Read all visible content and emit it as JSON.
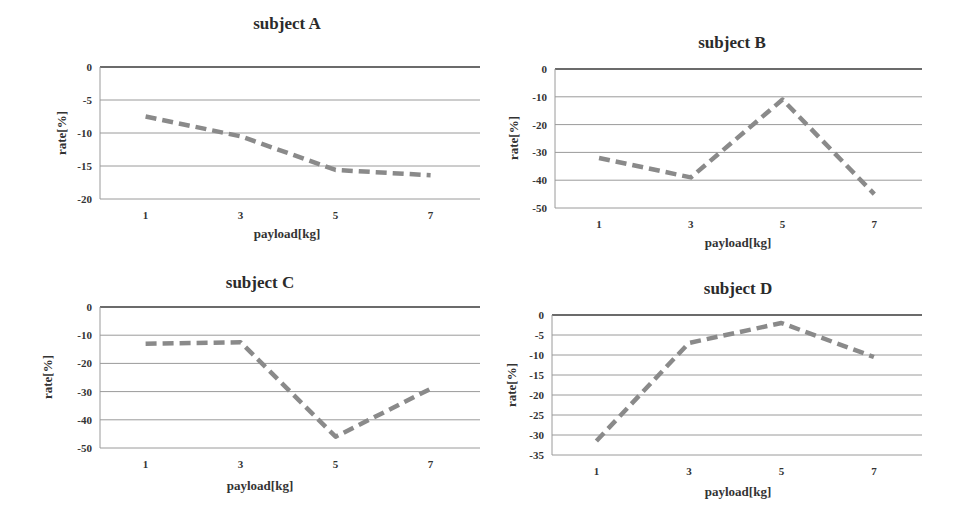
{
  "chart_data": [
    {
      "type": "line",
      "title": "subject A",
      "xlabel": "payload[kg]",
      "ylabel": "rate[%]",
      "categories": [
        "1",
        "3",
        "5",
        "7"
      ],
      "values": [
        -7.5,
        -10.5,
        -15.6,
        -16.4
      ],
      "ylim": [
        -20,
        0
      ],
      "yticks": [
        0,
        -5,
        -10,
        -15,
        -20
      ],
      "grid": true,
      "line_style": "dashed",
      "line_color": "#8a8a8a"
    },
    {
      "type": "line",
      "title": "subject B",
      "xlabel": "payload[kg]",
      "ylabel": "rate[%]",
      "categories": [
        "1",
        "3",
        "5",
        "7"
      ],
      "values": [
        -32,
        -39,
        -11,
        -45
      ],
      "ylim": [
        -50,
        0
      ],
      "yticks": [
        0,
        -10,
        -20,
        -30,
        -40,
        -50
      ],
      "grid": true,
      "line_style": "dashed",
      "line_color": "#8a8a8a"
    },
    {
      "type": "line",
      "title": "subject C",
      "xlabel": "payload[kg]",
      "ylabel": "rate[%]",
      "categories": [
        "1",
        "3",
        "5",
        "7"
      ],
      "values": [
        -13,
        -12.5,
        -46,
        -29
      ],
      "ylim": [
        -50,
        0
      ],
      "yticks": [
        0,
        -10,
        -20,
        -30,
        -40,
        -50
      ],
      "grid": true,
      "line_style": "dashed",
      "line_color": "#8a8a8a"
    },
    {
      "type": "line",
      "title": "subject D",
      "xlabel": "payload[kg]",
      "ylabel": "rate[%]",
      "categories": [
        "1",
        "3",
        "5",
        "7"
      ],
      "values": [
        -31.5,
        -7,
        -2,
        -10.5
      ],
      "ylim": [
        -35,
        0
      ],
      "yticks": [
        0,
        -5,
        -10,
        -15,
        -20,
        -25,
        -30,
        -35
      ],
      "grid": true,
      "line_style": "dashed",
      "line_color": "#8a8a8a"
    }
  ],
  "layout": [
    {
      "panel": {
        "left": 0,
        "top": 0
      },
      "plot": {
        "x0": 100,
        "x1": 480,
        "y0": 67,
        "y1": 199
      },
      "title_center": [
        287,
        24
      ],
      "xlabel_center": [
        287,
        234
      ],
      "ylabel_center": [
        62,
        133
      ]
    },
    {
      "panel": {
        "left": 0,
        "top": 0
      },
      "plot": {
        "x0": 555,
        "x1": 922,
        "y0": 69,
        "y1": 208
      },
      "title_center": [
        732,
        43
      ],
      "xlabel_center": [
        738,
        243
      ],
      "ylabel_center": [
        514,
        138
      ]
    },
    {
      "panel": {
        "left": 0,
        "top": 0
      },
      "plot": {
        "x0": 100,
        "x1": 480,
        "y0": 307,
        "y1": 448
      },
      "title_center": [
        260,
        283
      ],
      "xlabel_center": [
        260,
        486
      ],
      "ylabel_center": [
        48,
        377
      ]
    },
    {
      "panel": {
        "left": 0,
        "top": 0
      },
      "plot": {
        "x0": 552,
        "x1": 922,
        "y0": 315,
        "y1": 455
      },
      "title_center": [
        738,
        289
      ],
      "xlabel_center": [
        738,
        492
      ],
      "ylabel_center": [
        512,
        385
      ]
    }
  ]
}
